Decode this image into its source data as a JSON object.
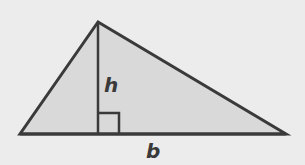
{
  "diagram": {
    "type": "triangle-area",
    "labels": {
      "height": "h",
      "base": "b"
    },
    "colors": {
      "background": "#ececec",
      "fill": "#d9d9d9",
      "stroke": "#3a3a3a"
    },
    "vertices": {
      "apex": [
        98,
        22
      ],
      "left": [
        20,
        134
      ],
      "right": [
        286,
        134
      ]
    },
    "right_angle_marker": {
      "x": 98,
      "y": 113,
      "size": 21
    }
  }
}
